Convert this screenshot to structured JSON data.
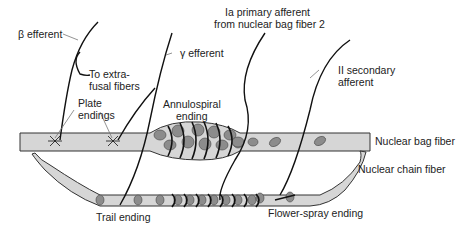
{
  "diagram": {
    "colors": {
      "fiber": "#d6d6d6",
      "nucleus": "#8c8c8c",
      "line": "#1a1a1a",
      "leader": "#777777"
    },
    "labels": {
      "beta_efferent": "β efferent",
      "to_extrafusal_1": "To extra-",
      "to_extrafusal_2": "fusal fibers",
      "gamma_efferent": "γ efferent",
      "ia_1": "Ia primary afferent",
      "ia_2": "from nuclear bag fiber 2",
      "ii_1": "II secondary",
      "ii_2": "afferent",
      "plate_1": "Plate",
      "plate_2": "endings",
      "annulo_1": "Annulospiral",
      "annulo_2": "ending",
      "nuclear_bag": "Nuclear bag fiber",
      "nuclear_chain": "Nuclear chain fiber",
      "trail": "Trail ending",
      "flower": "Flower-spray ending"
    }
  }
}
